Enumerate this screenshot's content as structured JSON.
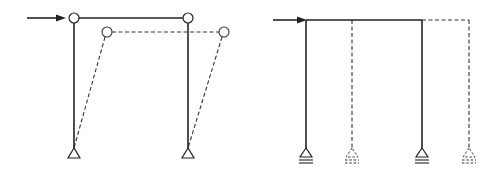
{
  "figure": {
    "panels": [
      {
        "id": "left",
        "subject": "pinned portal frame with hinged beam-column joints, original (solid) and displaced/swayed (dashed) shape",
        "load": "horizontal-point-load",
        "joints": "hinge",
        "supports": "pin",
        "displaced_shape": "dashed"
      },
      {
        "id": "right",
        "subject": "portal frame on roller supports translating horizontally, original (solid) and translated (dashed) shape",
        "load": "horizontal-point-load",
        "joints": "rigid",
        "supports": "roller",
        "displaced_shape": "dashed"
      }
    ],
    "colors": {
      "line": "#222222",
      "background": "#ffffff"
    }
  }
}
